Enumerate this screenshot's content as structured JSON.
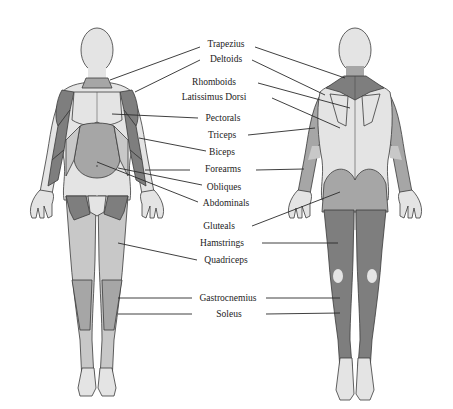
{
  "diagram": {
    "title": "",
    "views": [
      "front",
      "back"
    ],
    "colors": {
      "skin": "#e4e4e4",
      "muscle_light": "#c8c8c8",
      "muscle_mid": "#a6a6a6",
      "muscle_dark": "#7e7e7e",
      "outline": "#3a3a3a",
      "leader_line": "#2a2a2a",
      "text": "#222222"
    },
    "labels": [
      {
        "id": "trapezius",
        "text": "Trapezius",
        "x": 226,
        "y": 18
      },
      {
        "id": "deltoids",
        "text": "Deltoids",
        "x": 226,
        "y": 33
      },
      {
        "id": "rhomboids",
        "text": "Rhomboids",
        "x": 214,
        "y": 56
      },
      {
        "id": "latissimus-dorsi",
        "text": "Latissimus Dorsi",
        "x": 214,
        "y": 70
      },
      {
        "id": "pectorals",
        "text": "Pectorals",
        "x": 223,
        "y": 90
      },
      {
        "id": "triceps",
        "text": "Triceps",
        "x": 222,
        "y": 107
      },
      {
        "id": "biceps",
        "text": "Biceps",
        "x": 222,
        "y": 124
      },
      {
        "id": "forearms",
        "text": "Forearms",
        "x": 223,
        "y": 141
      },
      {
        "id": "obliques",
        "text": "Obliques",
        "x": 224,
        "y": 158
      },
      {
        "id": "abdominals",
        "text": "Abdominals",
        "x": 226,
        "y": 174
      },
      {
        "id": "gluteals",
        "text": "Gluteals",
        "x": 219,
        "y": 197
      },
      {
        "id": "hamstrings",
        "text": "Hamstrings",
        "x": 222,
        "y": 214
      },
      {
        "id": "quadriceps",
        "text": "Quadriceps",
        "x": 226,
        "y": 230
      },
      {
        "id": "gastrocnemius",
        "text": "Gastrocnemius",
        "x": 228,
        "y": 265
      },
      {
        "id": "soleus",
        "text": "Soleus",
        "x": 229,
        "y": 281
      }
    ]
  }
}
